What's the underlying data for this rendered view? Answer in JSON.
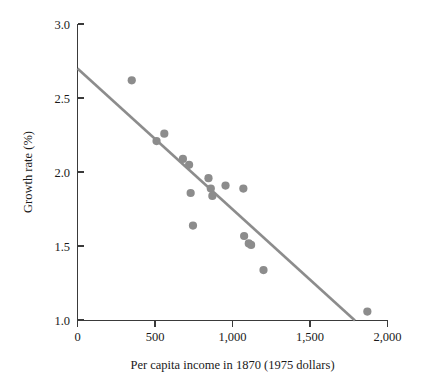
{
  "chart_data": {
    "type": "scatter",
    "title": "",
    "xlabel": "Per capita income in 1870 (1975 dollars)",
    "ylabel": "Growth rate (%)",
    "xlim": [
      0,
      2000
    ],
    "ylim": [
      1.0,
      3.0
    ],
    "xticks": [
      0,
      500,
      1000,
      1500,
      2000
    ],
    "xtick_labels": [
      "0",
      "500",
      "1,000",
      "1,500",
      "2,000"
    ],
    "yticks": [
      1.0,
      1.5,
      2.0,
      2.5,
      3.0
    ],
    "ytick_labels": [
      "1.0",
      "1.5",
      "2.0",
      "2.5",
      "3.0"
    ],
    "grid": false,
    "legend": null,
    "marker_color": "#8c8c8c",
    "line_color": "#8c8c8c",
    "axis_color": "#3a3a3a",
    "points": [
      {
        "x": 350,
        "y": 2.62
      },
      {
        "x": 510,
        "y": 2.21
      },
      {
        "x": 560,
        "y": 2.26
      },
      {
        "x": 680,
        "y": 2.09
      },
      {
        "x": 720,
        "y": 2.05
      },
      {
        "x": 730,
        "y": 1.86
      },
      {
        "x": 745,
        "y": 1.64
      },
      {
        "x": 845,
        "y": 1.96
      },
      {
        "x": 860,
        "y": 1.89
      },
      {
        "x": 870,
        "y": 1.84
      },
      {
        "x": 955,
        "y": 1.91
      },
      {
        "x": 1070,
        "y": 1.89
      },
      {
        "x": 1075,
        "y": 1.57
      },
      {
        "x": 1105,
        "y": 1.52
      },
      {
        "x": 1120,
        "y": 1.51
      },
      {
        "x": 1200,
        "y": 1.34
      },
      {
        "x": 1870,
        "y": 1.06
      }
    ],
    "fit_line": {
      "label": "regression line",
      "x_start": 0,
      "y_start": 2.7,
      "x_end": 1790,
      "y_end": 1.0
    }
  }
}
